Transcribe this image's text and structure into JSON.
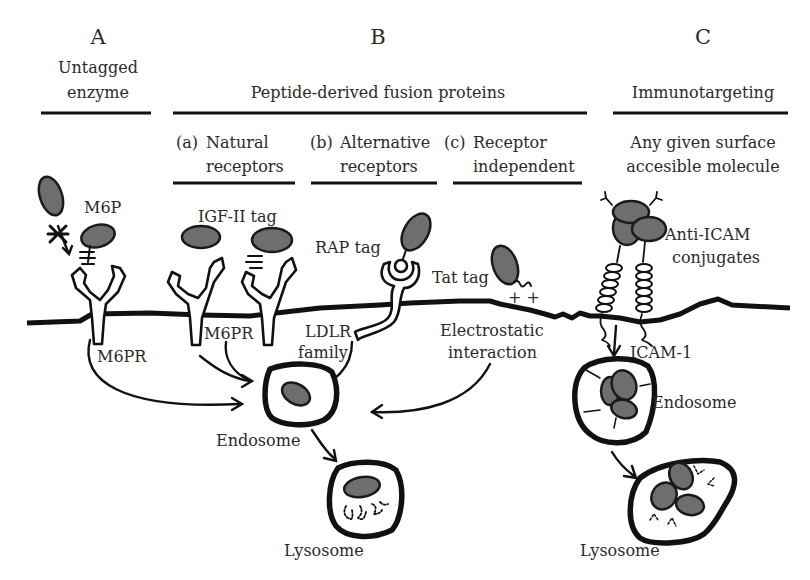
{
  "sections": {
    "A": {
      "letter": "A",
      "title_line1": "Untagged",
      "title_line2": "enzyme"
    },
    "B": {
      "letter": "B",
      "title": "Peptide-derived fusion proteins",
      "sub": [
        {
          "prefix": "(a)",
          "line1": "Natural",
          "line2": "receptors"
        },
        {
          "prefix": "(b)",
          "line1": "Alternative",
          "line2": "receptors"
        },
        {
          "prefix": "(c)",
          "line1": "Receptor",
          "line2": "independent"
        }
      ]
    },
    "C": {
      "letter": "C",
      "title": "Immunotargeting",
      "sub_line1": "Any given surface",
      "sub_line2": "accesible molecule"
    }
  },
  "labels": {
    "m6p": "M6P",
    "m6pr_a": "M6PR",
    "igf2_tag": "IGF-II tag",
    "m6pr_b": "M6PR",
    "rap_tag": "RAP tag",
    "ldlr_line1": "LDLR",
    "ldlr_line2": "family",
    "tat_tag": "Tat tag",
    "charge": "+ +",
    "electro_line1": "Electrostatic",
    "electro_line2": "interaction",
    "anti_icam_line1": "Anti-ICAM",
    "anti_icam_line2": "conjugates",
    "icam1": "ICAM-1",
    "endosome_b": "Endosome",
    "lysosome_b": "Lysosome",
    "endosome_c": "Endosome",
    "lysosome_c": "Lysosome"
  },
  "colors": {
    "enzyme_fill": "#6e6e6e",
    "stroke": "#111111",
    "text": "#2a2a2a",
    "background": "#ffffff"
  }
}
